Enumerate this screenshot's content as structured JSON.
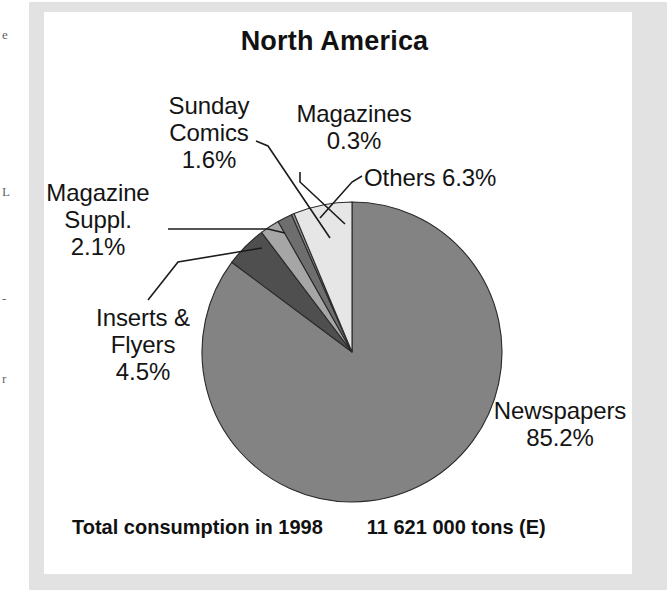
{
  "document": {
    "panel_background": "#ffffff",
    "frame_color": "#e2e2e2",
    "edge_fragments": [
      "e",
      "L",
      "-",
      "r"
    ]
  },
  "chart_data": {
    "type": "pie",
    "title": "North America",
    "xlabel": "",
    "ylabel": "",
    "categories": [
      "Newspapers",
      "Others",
      "Magazines",
      "Sunday Comics",
      "Magazine Suppl.",
      "Inserts & Flyers"
    ],
    "values": [
      85.2,
      6.3,
      0.3,
      1.6,
      2.1,
      4.5
    ],
    "value_unit": "%",
    "slices": [
      {
        "name": "Newspapers",
        "label_text": "Newspapers",
        "value": 85.2,
        "value_text": "85.2%",
        "color": "#838383",
        "start_angle": 0,
        "end_angle": 306.72
      },
      {
        "name": "Inserts & Flyers",
        "label_text": "Inserts &\nFlyers",
        "value": 4.5,
        "value_text": "4.5%",
        "color": "#4f4f4f",
        "start_angle": 306.72,
        "end_angle": 322.92
      },
      {
        "name": "Magazine Suppl.",
        "label_text": "Magazine\nSuppl.",
        "value": 2.1,
        "value_text": "2.1%",
        "color": "#a6a6a6",
        "start_angle": 322.92,
        "end_angle": 330.48
      },
      {
        "name": "Sunday Comics",
        "label_text": "Sunday\nComics",
        "value": 1.6,
        "value_text": "1.6%",
        "color": "#6e6e6e",
        "start_angle": 330.48,
        "end_angle": 336.24
      },
      {
        "name": "Magazines",
        "label_text": "Magazines",
        "value": 0.3,
        "value_text": "0.3%",
        "color": "#8f8f8f",
        "start_angle": 336.24,
        "end_angle": 337.32
      },
      {
        "name": "Others",
        "label_text": "Others",
        "value": 6.3,
        "value_text": "6.3%",
        "color": "#e6e6e6",
        "start_angle": 337.32,
        "end_angle": 360
      }
    ],
    "legend_position": "callout-labels",
    "grid": false,
    "total_caption": "Total consumption in 1998",
    "total_value": "11 621 000 tons (E)"
  },
  "labels": {
    "sunday_comics": "Sunday\nComics\n1.6%",
    "magazines": "Magazines\n0.3%",
    "others": "Others 6.3%",
    "magazine_suppl": "Magazine\nSuppl.\n2.1%",
    "inserts_flyers": "Inserts &\nFlyers\n4.5%",
    "newspapers": "Newspapers\n85.2%"
  },
  "footer": {
    "caption": "Total consumption in 1998",
    "value": "11 621 000 tons (E)"
  }
}
